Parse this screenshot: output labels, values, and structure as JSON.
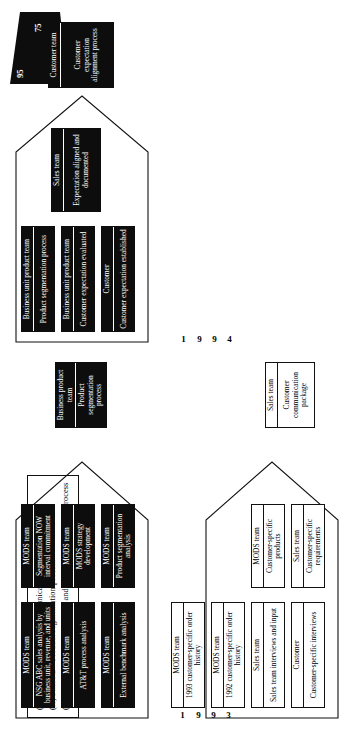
{
  "figure": {
    "legend": {
      "name": "phase-legend",
      "items": [
        "(X) Phase 1—Customer communication package",
        "(X) Phase 2—Product segmentation process",
        "( ) Phase 3—Customer teaming and expectation alignment process"
      ]
    },
    "scale_marker": {
      "name": "trapezoid-scale-marker",
      "values": [
        "95",
        "95",
        "75"
      ],
      "fill": "#0d0d0d",
      "text_color": "#ffffff"
    },
    "colors": {
      "outline": "#111111",
      "fill_black": "#0d0d0d",
      "fill_white": "#ffffff"
    },
    "phases": [
      {
        "id": "phase-1",
        "name": "customer-communication-package",
        "year": "1993",
        "year_digits": [
          "1",
          "9",
          "9",
          "3"
        ],
        "inputs": [
          {
            "who": "Customer",
            "what": "Customer-specific interviews",
            "style": "white"
          },
          {
            "who": "Sales team",
            "what": "Sales team interviews and input",
            "style": "white"
          },
          {
            "who": "MODS team",
            "what": "1992 customer-specific order history",
            "style": "white"
          },
          {
            "who": "MODS team",
            "what": "1993 customer-specific order history",
            "style": "white"
          }
        ],
        "mid": [
          {
            "who": "Sales team",
            "what": "Customer-specific requirements",
            "style": "white"
          },
          {
            "who": "MODS team",
            "what": "Customer-specific products",
            "style": "white"
          }
        ],
        "output": {
          "who": "Sales team",
          "what": "Customer communication package",
          "style": "white"
        }
      },
      {
        "id": "phase-2",
        "name": "product-segmentation-process",
        "year": "1993",
        "year_digits": [
          "1",
          "9",
          "9",
          "3"
        ],
        "inputs": [
          {
            "who": "MODS team",
            "what": "External benchmark analysis",
            "style": "black"
          },
          {
            "who": "MODS team",
            "what": "AT&T process analysis",
            "style": "black"
          },
          {
            "who": "MODS team",
            "what": "NSG ABC sales analysis by business unit, revenue, and units",
            "style": "black"
          },
          {
            "who": "MODS team",
            "what": "Product segmentation analysis",
            "style": "black"
          }
        ],
        "mid": [
          {
            "who": "MODS team",
            "what": "MODS strategy development",
            "style": "black"
          },
          {
            "who": "MODS team",
            "what": "Segmentation NOW interval commitment",
            "style": "black"
          }
        ],
        "output": {
          "who": "Business product team",
          "what": "Product segmentation process",
          "style": "black"
        }
      },
      {
        "id": "phase-3",
        "name": "customer-expectation-alignment-process",
        "year": "1994",
        "year_digits": [
          "1",
          "9",
          "9",
          "4"
        ],
        "inputs": [
          {
            "who": "Customer",
            "what": "Customer expectation established",
            "style": "black"
          },
          {
            "who": "Business unit product team",
            "what": "Customer expectation evaluated",
            "style": "black"
          },
          {
            "who": "Business unit product team",
            "what": "Product segmentation process",
            "style": "black"
          }
        ],
        "mid": [
          {
            "who": "Sales team",
            "what": "Expectation aligned and documented",
            "style": "black"
          }
        ],
        "output": {
          "who": "Customer team",
          "what": "Customer expectation alignment process",
          "style": "black"
        }
      }
    ]
  }
}
